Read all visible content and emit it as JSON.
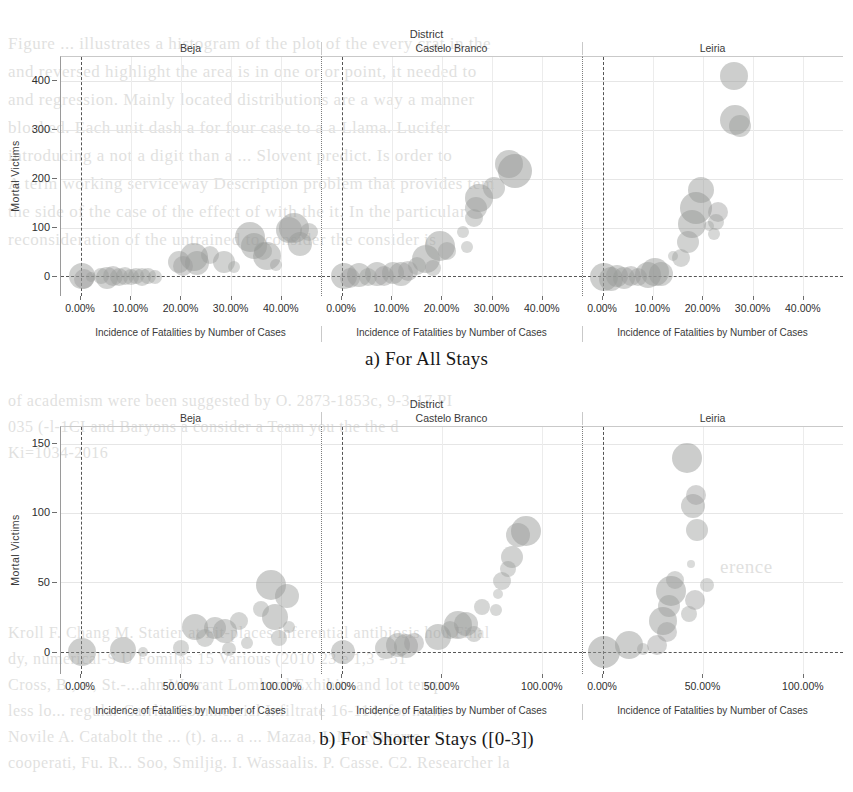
{
  "page": {
    "background_color": "#ffffff",
    "bleed_text": [
      {
        "text": "Figure ... illustrates a histogram of the plot of the every crat in the",
        "x": 8,
        "y": 34,
        "size": 17
      },
      {
        "text": "and reversed highlight the area is in one or or point, it needed to",
        "x": 8,
        "y": 62,
        "size": 17
      },
      {
        "text": "and regression. Mainly located distributions are a way a manner",
        "x": 8,
        "y": 90,
        "size": 17
      },
      {
        "text": "blocked. Each unit dash a for four case to a a Llama. Lucifer",
        "x": 8,
        "y": 118,
        "size": 17
      },
      {
        "text": "introducing a not a digit than a ... Slovent predict. Is order to",
        "x": 8,
        "y": 146,
        "size": 17
      },
      {
        "text": "A term working serviceway Description problem that provides tem",
        "x": 8,
        "y": 174,
        "size": 17
      },
      {
        "text": "the side of the case of the effect of with the it. In the particular",
        "x": 8,
        "y": 202,
        "size": 17
      },
      {
        "text": "reconsideration of the untrained to consider the consider is",
        "x": 8,
        "y": 230,
        "size": 17
      },
      {
        "text": "of academism      were been suggested by  O. 2873-1853c, 9-3-17 PI",
        "x": 8,
        "y": 392,
        "size": 16
      },
      {
        "text": "035 (-l-1CI     and Baryons a consider a Team you   the   the   d",
        "x": 8,
        "y": 418,
        "size": 16
      },
      {
        "text": "Ki=1034-2016",
        "x": 8,
        "y": 444,
        "size": 16
      },
      {
        "text": "erence",
        "x": 720,
        "y": 556,
        "size": 19
      },
      {
        "text": "Kroll  F.  Chang M. Statier at Fit-places inferential antibiosis hou  Final",
        "x": 8,
        "y": 624,
        "size": 16
      },
      {
        "text": "dy, numerical-S U Fomilas 15 Various (2010 23 e 1,3 - 51",
        "x": 8,
        "y": 650,
        "size": 16
      },
      {
        "text": "Cross, B., a., St.-...ahn Warrant Lombard  Exhibits   and lot  temp",
        "x": 8,
        "y": 676,
        "size": 16
      },
      {
        "text": "less     lo...  regular  Carrlin  Commercial   Infiltrate  16-114.  for mem",
        "x": 8,
        "y": 702,
        "size": 16
      },
      {
        "text": "Novile  A. Catabolt  the ... (t).  a...  a ... Mazaa,  J. M., Navarro",
        "x": 8,
        "y": 728,
        "size": 16
      },
      {
        "text": "cooperati, Fu. R... Soo, Smiljig. I. Wassaalis. P. Casse. C2. Researcher   la",
        "x": 8,
        "y": 754,
        "size": 16
      }
    ]
  },
  "chart_data": [
    {
      "id": "chart-a",
      "type": "scatter",
      "title": "a) For All Stays",
      "facet_title": "District",
      "facets": [
        "Beja",
        "Castelo Branco",
        "Leiria"
      ],
      "xlabel": "Incidence of Fatalities by Number of Cases",
      "ylabel": "Mortal Victims",
      "xticks": [
        "0.00%",
        "10.00%",
        "20.00%",
        "30.00%",
        "40.00%"
      ],
      "xtick_values": [
        0,
        10,
        20,
        30,
        40
      ],
      "xlim": [
        -4,
        48
      ],
      "yticks": [
        "0",
        "100",
        "200",
        "300",
        "400"
      ],
      "ytick_values": [
        0,
        100,
        200,
        300,
        400
      ],
      "ylim": [
        -40,
        450
      ],
      "grid": true,
      "legend": "none",
      "bubble_color": "#969896",
      "series": [
        {
          "name": "Beja",
          "points": [
            {
              "x": 0.2,
              "y": 2,
              "size": 13
            },
            {
              "x": 0.6,
              "y": -5,
              "size": 10
            },
            {
              "x": 2.0,
              "y": 0,
              "size": 5
            },
            {
              "x": 4.0,
              "y": 1,
              "size": 8
            },
            {
              "x": 5.2,
              "y": -3,
              "size": 11
            },
            {
              "x": 6.4,
              "y": 2,
              "size": 10
            },
            {
              "x": 7.5,
              "y": 0,
              "size": 9
            },
            {
              "x": 8.7,
              "y": 1,
              "size": 9
            },
            {
              "x": 9.9,
              "y": -2,
              "size": 8
            },
            {
              "x": 11.0,
              "y": 2,
              "size": 8
            },
            {
              "x": 12.2,
              "y": 0,
              "size": 9
            },
            {
              "x": 13.4,
              "y": 1,
              "size": 8
            },
            {
              "x": 14.8,
              "y": 0,
              "size": 7
            },
            {
              "x": 19.5,
              "y": 30,
              "size": 11
            },
            {
              "x": 20.4,
              "y": 22,
              "size": 10
            },
            {
              "x": 22.5,
              "y": 40,
              "size": 14
            },
            {
              "x": 23.2,
              "y": 27,
              "size": 12
            },
            {
              "x": 25.8,
              "y": 44,
              "size": 9
            },
            {
              "x": 28.5,
              "y": 30,
              "size": 11
            },
            {
              "x": 30.6,
              "y": 20,
              "size": 6
            },
            {
              "x": 33.8,
              "y": 80,
              "size": 15
            },
            {
              "x": 34.6,
              "y": 62,
              "size": 13
            },
            {
              "x": 36.4,
              "y": 52,
              "size": 9
            },
            {
              "x": 37.2,
              "y": 42,
              "size": 14
            },
            {
              "x": 38.9,
              "y": 23,
              "size": 6
            },
            {
              "x": 41.6,
              "y": 95,
              "size": 13
            },
            {
              "x": 42.6,
              "y": 100,
              "size": 15
            },
            {
              "x": 43.8,
              "y": 66,
              "size": 12
            },
            {
              "x": 45.5,
              "y": 92,
              "size": 9
            }
          ]
        },
        {
          "name": "Castelo Branco",
          "points": [
            {
              "x": 0.3,
              "y": 1,
              "size": 13
            },
            {
              "x": 1.6,
              "y": -4,
              "size": 10
            },
            {
              "x": 3.4,
              "y": 3,
              "size": 12
            },
            {
              "x": 5.2,
              "y": 0,
              "size": 9
            },
            {
              "x": 6.9,
              "y": 5,
              "size": 12
            },
            {
              "x": 8.4,
              "y": 2,
              "size": 10
            },
            {
              "x": 10.1,
              "y": 8,
              "size": 11
            },
            {
              "x": 11.7,
              "y": 6,
              "size": 12
            },
            {
              "x": 13.2,
              "y": 12,
              "size": 10
            },
            {
              "x": 15.0,
              "y": 22,
              "size": 9
            },
            {
              "x": 16.8,
              "y": 35,
              "size": 14
            },
            {
              "x": 18.2,
              "y": 18,
              "size": 8
            },
            {
              "x": 19.6,
              "y": 62,
              "size": 15
            },
            {
              "x": 21.0,
              "y": 52,
              "size": 9
            },
            {
              "x": 25.0,
              "y": 60,
              "size": 6
            },
            {
              "x": 26.4,
              "y": 120,
              "size": 9
            },
            {
              "x": 26.8,
              "y": 140,
              "size": 11
            },
            {
              "x": 27.4,
              "y": 160,
              "size": 14
            },
            {
              "x": 30.4,
              "y": 182,
              "size": 11
            },
            {
              "x": 33.4,
              "y": 230,
              "size": 14
            },
            {
              "x": 34.6,
              "y": 216,
              "size": 17
            },
            {
              "x": 24.2,
              "y": 92,
              "size": 6
            }
          ]
        },
        {
          "name": "Leiria",
          "points": [
            {
              "x": 0.2,
              "y": 0,
              "size": 14
            },
            {
              "x": 1.5,
              "y": -6,
              "size": 12
            },
            {
              "x": 2.8,
              "y": 2,
              "size": 11
            },
            {
              "x": 4.1,
              "y": -3,
              "size": 11
            },
            {
              "x": 5.6,
              "y": 1,
              "size": 10
            },
            {
              "x": 7.0,
              "y": -2,
              "size": 9
            },
            {
              "x": 9.0,
              "y": 4,
              "size": 13
            },
            {
              "x": 10.3,
              "y": 10,
              "size": 14
            },
            {
              "x": 11.5,
              "y": 5,
              "size": 12
            },
            {
              "x": 15.6,
              "y": 38,
              "size": 9
            },
            {
              "x": 13.9,
              "y": 42,
              "size": 5
            },
            {
              "x": 17.0,
              "y": 70,
              "size": 11
            },
            {
              "x": 17.8,
              "y": 108,
              "size": 14
            },
            {
              "x": 18.6,
              "y": 140,
              "size": 16
            },
            {
              "x": 19.5,
              "y": 178,
              "size": 13
            },
            {
              "x": 22.2,
              "y": 88,
              "size": 6
            },
            {
              "x": 23.0,
              "y": 132,
              "size": 10
            },
            {
              "x": 22.6,
              "y": 112,
              "size": 8
            },
            {
              "x": 26.3,
              "y": 320,
              "size": 15
            },
            {
              "x": 27.4,
              "y": 308,
              "size": 11
            },
            {
              "x": 26.1,
              "y": 412,
              "size": 14
            },
            {
              "x": 21.2,
              "y": 104,
              "size": 5
            }
          ]
        }
      ]
    },
    {
      "id": "chart-b",
      "type": "scatter",
      "title": "b) For Shorter Stays ([0-3])",
      "facet_title": "District",
      "facets": [
        "Beja",
        "Castelo Branco",
        "Leiria"
      ],
      "xlabel": "Incidence of Fatalities by Number of Cases",
      "ylabel": "Mortal Victims",
      "xticks": [
        "0.00%",
        "50.00%",
        "100.00%"
      ],
      "xtick_values": [
        0,
        50,
        100
      ],
      "xlim": [
        -10,
        120
      ],
      "yticks": [
        "0",
        "50",
        "100",
        "150"
      ],
      "ytick_values": [
        0,
        50,
        100,
        150
      ],
      "ylim": [
        -16,
        162
      ],
      "grid": true,
      "legend": "none",
      "bubble_color": "#969896",
      "series": [
        {
          "name": "Beja",
          "points": [
            {
              "x": 0.5,
              "y": 0,
              "size": 14
            },
            {
              "x": 21.0,
              "y": 1,
              "size": 13
            },
            {
              "x": 31.0,
              "y": 0,
              "size": 5
            },
            {
              "x": 50.0,
              "y": 3,
              "size": 8
            },
            {
              "x": 57.0,
              "y": 18,
              "size": 13
            },
            {
              "x": 62.0,
              "y": 10,
              "size": 9
            },
            {
              "x": 67.0,
              "y": 17,
              "size": 11
            },
            {
              "x": 72.0,
              "y": 15,
              "size": 12
            },
            {
              "x": 74.0,
              "y": 2,
              "size": 7
            },
            {
              "x": 79.0,
              "y": 22,
              "size": 9
            },
            {
              "x": 83.0,
              "y": 6,
              "size": 6
            },
            {
              "x": 90.0,
              "y": 31,
              "size": 8
            },
            {
              "x": 95.0,
              "y": 48,
              "size": 15
            },
            {
              "x": 97.0,
              "y": 25,
              "size": 13
            },
            {
              "x": 99.0,
              "y": 10,
              "size": 8
            },
            {
              "x": 103.0,
              "y": 40,
              "size": 12
            },
            {
              "x": 104.0,
              "y": 18,
              "size": 6
            }
          ]
        },
        {
          "name": "Castelo Branco",
          "points": [
            {
              "x": 0.4,
              "y": 0,
              "size": 12
            },
            {
              "x": 22.0,
              "y": 3,
              "size": 11
            },
            {
              "x": 28.0,
              "y": 5,
              "size": 12
            },
            {
              "x": 32.0,
              "y": 4,
              "size": 12
            },
            {
              "x": 36.0,
              "y": 6,
              "size": 10
            },
            {
              "x": 48.0,
              "y": 11,
              "size": 13
            },
            {
              "x": 54.0,
              "y": 16,
              "size": 9
            },
            {
              "x": 58.0,
              "y": 19,
              "size": 14
            },
            {
              "x": 62.0,
              "y": 20,
              "size": 12
            },
            {
              "x": 66.0,
              "y": 13,
              "size": 8
            },
            {
              "x": 70.0,
              "y": 32,
              "size": 8
            },
            {
              "x": 77.0,
              "y": 30,
              "size": 6
            },
            {
              "x": 80.0,
              "y": 51,
              "size": 9
            },
            {
              "x": 83.0,
              "y": 60,
              "size": 8
            },
            {
              "x": 85.0,
              "y": 68,
              "size": 11
            },
            {
              "x": 88.0,
              "y": 84,
              "size": 12
            },
            {
              "x": 92.0,
              "y": 87,
              "size": 15
            },
            {
              "x": 78.0,
              "y": 42,
              "size": 5
            }
          ]
        },
        {
          "name": "Leiria",
          "points": [
            {
              "x": 0.5,
              "y": 0,
              "size": 16
            },
            {
              "x": 13.0,
              "y": 5,
              "size": 14
            },
            {
              "x": 20.0,
              "y": 2,
              "size": 6
            },
            {
              "x": 27.0,
              "y": 5,
              "size": 10
            },
            {
              "x": 32.0,
              "y": 14,
              "size": 10
            },
            {
              "x": 30.0,
              "y": 22,
              "size": 14
            },
            {
              "x": 33.0,
              "y": 33,
              "size": 11
            },
            {
              "x": 34.0,
              "y": 44,
              "size": 15
            },
            {
              "x": 36.0,
              "y": 52,
              "size": 9
            },
            {
              "x": 43.0,
              "y": 27,
              "size": 8
            },
            {
              "x": 46.0,
              "y": 37,
              "size": 10
            },
            {
              "x": 44.0,
              "y": 63,
              "size": 4
            },
            {
              "x": 47.0,
              "y": 88,
              "size": 11
            },
            {
              "x": 45.0,
              "y": 105,
              "size": 12
            },
            {
              "x": 46.5,
              "y": 113,
              "size": 10
            },
            {
              "x": 42.0,
              "y": 140,
              "size": 15
            },
            {
              "x": 52.0,
              "y": 48,
              "size": 7
            }
          ]
        }
      ]
    }
  ]
}
